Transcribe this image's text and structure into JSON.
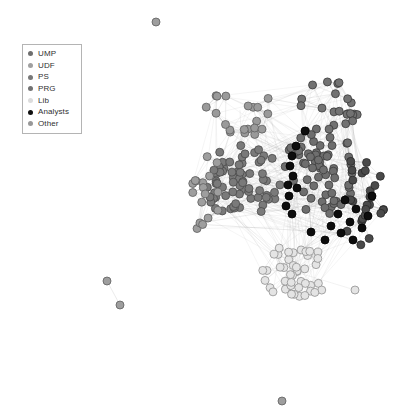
{
  "figure": {
    "type": "network-graph",
    "width": 413,
    "height": 417,
    "background": "#ffffff"
  },
  "legend": {
    "position": "top-left",
    "border_color": "#b4b4b4",
    "background": "#ffffff",
    "items": [
      {
        "label": "UMP",
        "color": "#6e6e6e"
      },
      {
        "label": "UDF",
        "color": "#a0a0a0"
      },
      {
        "label": "PS",
        "color": "#787878"
      },
      {
        "label": "PRG",
        "color": "#727272"
      },
      {
        "label": "Lib",
        "color": "#dcdcdc"
      },
      {
        "label": "Analysts",
        "color": "#101010"
      },
      {
        "label": "Other",
        "color": "#989898"
      }
    ]
  },
  "chart_data": {
    "type": "network",
    "title": "",
    "node_count": 268,
    "edge_style": {
      "color": "#9a9a9a",
      "opacity": 0.38,
      "width": 0.45
    },
    "node_style": {
      "radius": 4.0,
      "stroke_width": 0.8
    },
    "clusters": [
      {
        "name": "main-left-dense",
        "category": "PS",
        "fill": "#7a7a7a",
        "stroke": "#4a4a4a",
        "center": [
          243,
          183
        ],
        "radius_x": 40,
        "radius_y": 38,
        "count": 72,
        "seed": 11
      },
      {
        "name": "main-right-dense",
        "category": "UMP",
        "fill": "#6e6e6e",
        "stroke": "#3c3c3c",
        "center": [
          320,
          170
        ],
        "radius_x": 36,
        "radius_y": 46,
        "count": 64,
        "seed": 23
      },
      {
        "name": "upper-left-fringe",
        "category": "UDF",
        "fill": "#9a9a9a",
        "stroke": "#5e5e5e",
        "center": [
          240,
          110
        ],
        "radius_x": 34,
        "radius_y": 28,
        "count": 20,
        "seed": 37
      },
      {
        "name": "upper-right-fringe",
        "category": "PRG",
        "fill": "#727272",
        "stroke": "#3a3a3a",
        "center": [
          330,
          105
        ],
        "radius_x": 30,
        "radius_y": 26,
        "count": 22,
        "seed": 53
      },
      {
        "name": "left-periphery",
        "category": "Other",
        "fill": "#9e9e9e",
        "stroke": "#5e5e5e",
        "center": [
          205,
          195
        ],
        "radius_x": 22,
        "radius_y": 44,
        "count": 17,
        "seed": 67
      },
      {
        "name": "right-periphery-dark",
        "category": "PRG",
        "fill": "#4a4a4a",
        "stroke": "#2a2a2a",
        "center": [
          362,
          200
        ],
        "radius_x": 22,
        "radius_y": 48,
        "count": 26,
        "seed": 79
      },
      {
        "name": "lower-lib-cluster",
        "category": "Lib",
        "fill": "#e4e4e4",
        "stroke": "#909090",
        "center": [
          296,
          272
        ],
        "radius_x": 34,
        "radius_y": 28,
        "count": 44,
        "seed": 97
      }
    ],
    "analyst_chain": {
      "category": "Analysts",
      "fill": "#0d0d0d",
      "stroke": "#000000",
      "points": [
        [
          296,
          146
        ],
        [
          292,
          156
        ],
        [
          290,
          166
        ],
        [
          293,
          176
        ],
        [
          288,
          185
        ],
        [
          297,
          188
        ],
        [
          289,
          196
        ],
        [
          286,
          206
        ],
        [
          292,
          214
        ],
        [
          305,
          131
        ]
      ]
    },
    "analyst_scatter": {
      "category": "Analysts",
      "fill": "#0d0d0d",
      "stroke": "#000000",
      "points": [
        [
          345,
          200
        ],
        [
          356,
          209
        ],
        [
          338,
          214
        ],
        [
          350,
          222
        ],
        [
          362,
          228
        ],
        [
          341,
          233
        ],
        [
          353,
          240
        ],
        [
          331,
          226
        ],
        [
          368,
          216
        ],
        [
          325,
          240
        ],
        [
          311,
          232
        ],
        [
          372,
          196
        ]
      ]
    },
    "isolated_nodes": [
      {
        "x": 156,
        "y": 22,
        "fill": "#9e9e9e",
        "stroke": "#5e5e5e",
        "category": "Other"
      },
      {
        "x": 107,
        "y": 281,
        "fill": "#9e9e9e",
        "stroke": "#5e5e5e",
        "category": "Other"
      },
      {
        "x": 120,
        "y": 305,
        "fill": "#9e9e9e",
        "stroke": "#5e5e5e",
        "category": "Other"
      },
      {
        "x": 282,
        "y": 401,
        "fill": "#9e9e9e",
        "stroke": "#5e5e5e",
        "category": "Other"
      },
      {
        "x": 355,
        "y": 290,
        "fill": "#e4e4e4",
        "stroke": "#909090",
        "category": "Lib"
      }
    ],
    "isolated_edges": [
      {
        "from": [
          107,
          281
        ],
        "to": [
          120,
          305
        ]
      }
    ],
    "bridge_edges": [
      {
        "from": [
          296,
          146
        ],
        "to": [
          243,
          183
        ]
      },
      {
        "from": [
          292,
          214
        ],
        "to": [
          296,
          272
        ]
      },
      {
        "from": [
          290,
          166
        ],
        "to": [
          320,
          170
        ]
      },
      {
        "from": [
          240,
          110
        ],
        "to": [
          243,
          183
        ]
      },
      {
        "from": [
          330,
          105
        ],
        "to": [
          320,
          170
        ]
      },
      {
        "from": [
          205,
          195
        ],
        "to": [
          243,
          183
        ]
      },
      {
        "from": [
          362,
          200
        ],
        "to": [
          320,
          170
        ]
      },
      {
        "from": [
          296,
          272
        ],
        "to": [
          320,
          170
        ]
      },
      {
        "from": [
          355,
          290
        ],
        "to": [
          296,
          272
        ]
      },
      {
        "from": [
          296,
          272
        ],
        "to": [
          243,
          183
        ]
      }
    ]
  }
}
